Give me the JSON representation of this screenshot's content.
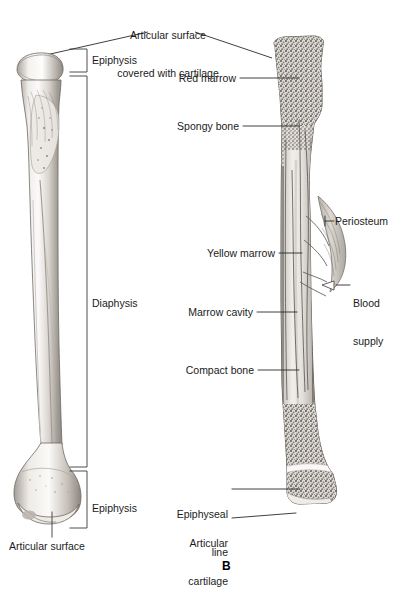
{
  "figure": {
    "panel_letter": "B",
    "title": {
      "line1": "Articular surface",
      "line2": "covered with cartilage"
    }
  },
  "left_bone": {
    "name": "whole-bone-exterior-view",
    "brackets": [
      {
        "key": "epiphysis_top",
        "label": "Epiphysis"
      },
      {
        "key": "diaphysis",
        "label": "Diaphysis"
      },
      {
        "key": "epiphysis_bottom",
        "label": "Epiphysis"
      }
    ],
    "callouts": [
      {
        "key": "articular_surface",
        "label": "Articular surface"
      }
    ]
  },
  "right_bone": {
    "name": "bone-longitudinal-section-view",
    "callouts": [
      {
        "key": "red_marrow",
        "label": "Red marrow"
      },
      {
        "key": "spongy_bone",
        "label": "Spongy bone"
      },
      {
        "key": "periosteum",
        "label": "Periosteum"
      },
      {
        "key": "yellow_marrow",
        "label": "Yellow marrow"
      },
      {
        "key": "blood_supply_l1",
        "label": "Blood"
      },
      {
        "key": "blood_supply_l2",
        "label": "supply"
      },
      {
        "key": "marrow_cavity",
        "label": "Marrow cavity"
      },
      {
        "key": "compact_bone",
        "label": "Compact bone"
      },
      {
        "key": "epiphyseal_line_l1",
        "label": "Epiphyseal"
      },
      {
        "key": "epiphyseal_line_l2",
        "label": "line"
      },
      {
        "key": "articular_cartilage_l1",
        "label": "Articular"
      },
      {
        "key": "articular_cartilage_l2",
        "label": "cartilage"
      }
    ]
  },
  "colors": {
    "ink": "#1b1b1b",
    "leader": "#2a2a2a",
    "bone_outline": "#555555",
    "bone_light": "#f3f1ee",
    "bone_mid": "#cfcac4",
    "bone_shadow": "#8f8a85",
    "cortex": "#9a948d",
    "spongy": "#b6b0a9",
    "cavity": "#e6e3df",
    "vessel": "#6f6a66",
    "periosteum": "#c9c4bd",
    "epiphyseal_line": "#f7f6f3"
  }
}
